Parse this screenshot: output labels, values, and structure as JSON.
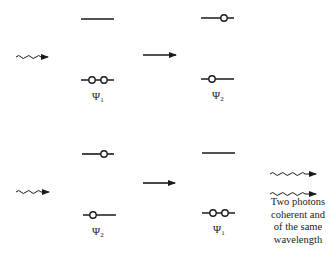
{
  "diagram": {
    "type": "stimulated-emission-energy-levels",
    "colors": {
      "line": "#1a1a1a",
      "background": "#ffffff"
    },
    "top_row": {
      "before": {
        "label_symbol": "Ψ",
        "label_sub": "1",
        "upper_electrons": 0,
        "lower_electrons": 2
      },
      "after": {
        "label_symbol": "Ψ",
        "label_sub": "2",
        "upper_electrons": 1,
        "lower_electrons": 1
      },
      "incoming": "photon-wavy-arrow",
      "transition": "right-arrow"
    },
    "bottom_row": {
      "before": {
        "label_symbol": "Ψ",
        "label_sub": "2",
        "upper_electrons": 1,
        "lower_electrons": 1
      },
      "after": {
        "label_symbol": "Ψ",
        "label_sub": "1",
        "upper_electrons": 0,
        "lower_electrons": 2
      },
      "incoming": "photon-wavy-arrow",
      "transition": "right-arrow",
      "outgoing": [
        "photon-wavy-arrow",
        "photon-wavy-arrow"
      ]
    },
    "caption_lines": [
      "Two photons",
      "coherent and",
      "of the same",
      "wavelength"
    ]
  }
}
